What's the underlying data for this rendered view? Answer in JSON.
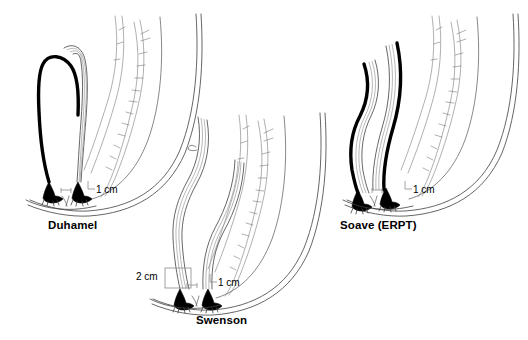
{
  "figure": {
    "background_color": "#ffffff",
    "ink_color": "#000000",
    "line_color": "#4a4a4a",
    "panels": [
      {
        "id": "duhamel",
        "label": "Duhamel",
        "measurements": [
          {
            "id": "duhamel-1cm",
            "text": "1 cm"
          }
        ]
      },
      {
        "id": "swenson",
        "label": "Swenson",
        "measurements": [
          {
            "id": "swenson-2cm",
            "text": "2 cm"
          },
          {
            "id": "swenson-1cm",
            "text": "1 cm"
          }
        ]
      },
      {
        "id": "soave",
        "label": "Soave (ERPT)",
        "measurements": [
          {
            "id": "soave-1cm",
            "text": "1 cm"
          }
        ]
      }
    ]
  }
}
